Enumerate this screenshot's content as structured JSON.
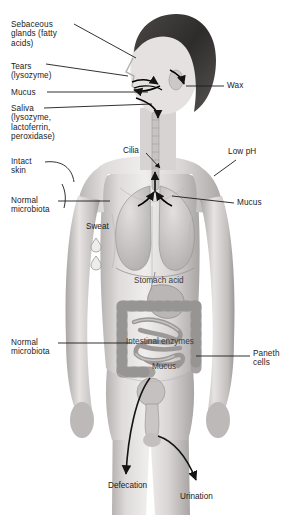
{
  "figure": {
    "style": "grayscale medical illustration"
  },
  "colors": {
    "background": "#ffffff",
    "label_text": "#1b1b1b",
    "onbody_text": "#3a3a3a",
    "leader_line": "#1b1b1b",
    "skin_light": "#e9e7e5",
    "skin_mid": "#cfcccb",
    "skin_shadow": "#a9a6a5",
    "hair_dark": "#3c3a39",
    "organ_mid": "#bdbab9",
    "organ_dark": "#8e8b8a"
  },
  "labels_left": [
    {
      "id": "sebaceous-glands",
      "text": "Sebaceous\nglands (fatty\nacids)",
      "x": 11,
      "y": 20
    },
    {
      "id": "tears",
      "text": "Tears\n(lysozyme)",
      "x": 11,
      "y": 62
    },
    {
      "id": "mucus-nose",
      "text": "Mucus",
      "x": 11,
      "y": 90
    },
    {
      "id": "saliva",
      "text": "Saliva\n(lysozyme,\nlactoferrin,\nperoxidase)",
      "x": 11,
      "y": 106
    },
    {
      "id": "intact-skin",
      "text": "Intact\nskin",
      "x": 11,
      "y": 158
    },
    {
      "id": "normal-microbiota-skin",
      "text": "Normal\nmicrobiota",
      "x": 11,
      "y": 198
    },
    {
      "id": "normal-microbiota-gut",
      "text": "Normal\nmicrobiota",
      "x": 11,
      "y": 340
    }
  ],
  "labels_right": [
    {
      "id": "wax",
      "text": "Wax",
      "x": 227,
      "y": 84
    },
    {
      "id": "low-ph",
      "text": "Low pH",
      "x": 228,
      "y": 151
    },
    {
      "id": "mucus-lung",
      "text": "Mucus",
      "x": 237,
      "y": 201
    },
    {
      "id": "paneth-cells",
      "text": "Paneth\ncells",
      "x": 253,
      "y": 352
    }
  ],
  "labels_onbody": [
    {
      "id": "cilia",
      "text": "Cilia",
      "x": 125,
      "y": 150
    },
    {
      "id": "sweat",
      "text": "Sweat",
      "x": 88,
      "y": 225
    },
    {
      "id": "stomach-acid",
      "text": "Stomach acid",
      "x": 137,
      "y": 279
    },
    {
      "id": "intestinal-enzymes",
      "text": "Intestinal enzymes",
      "x": 130,
      "y": 340
    },
    {
      "id": "mucus-intestine",
      "text": "Mucus",
      "x": 155,
      "y": 365
    },
    {
      "id": "defecation",
      "text": "Defecation",
      "x": 110,
      "y": 484
    },
    {
      "id": "urination",
      "text": "Urination",
      "x": 182,
      "y": 495
    }
  ]
}
